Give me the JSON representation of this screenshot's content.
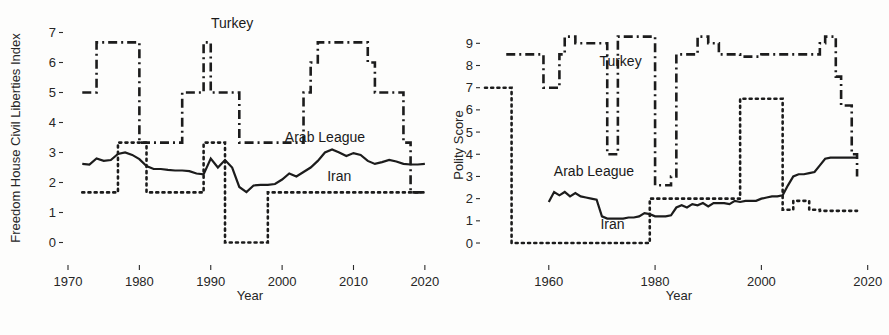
{
  "figure": {
    "background": "#fdfdfc",
    "line_color": "#1c1c1c",
    "panels": [
      "left",
      "right"
    ]
  },
  "chart_data": [
    {
      "id": "left",
      "type": "line",
      "title": "",
      "xlabel": "Year",
      "ylabel": "Freedom House Civil Liberties Index",
      "xlim": [
        1970,
        2021
      ],
      "ylim": [
        -0.35,
        7.35
      ],
      "xticks": [
        1970,
        1980,
        1990,
        2000,
        2010,
        2020
      ],
      "xticklabels": [
        "1970",
        "1980",
        "1990",
        "2000",
        "2010",
        "2020"
      ],
      "yticks": [
        0,
        1,
        2,
        3,
        4,
        5,
        6,
        7
      ],
      "yticklabels": [
        "0",
        "1",
        "2",
        "3",
        "4",
        "5",
        "6",
        "7"
      ],
      "grid": false,
      "legend_position": "inline-annotations",
      "annotations": [
        {
          "text": "Turkey",
          "x": 1993.0,
          "y": 7.15
        },
        {
          "text": "Arab League",
          "x": 2006.0,
          "y": 3.35
        },
        {
          "text": "Iran",
          "x": 2008.0,
          "y": 2.05
        }
      ],
      "series": [
        {
          "name": "Turkey",
          "style": "dashdot",
          "x": [
            1972,
            1973,
            1974,
            1975,
            1976,
            1977,
            1978,
            1979,
            1980,
            1981,
            1982,
            1983,
            1984,
            1985,
            1986,
            1987,
            1988,
            1989,
            1990,
            1991,
            1992,
            1993,
            1994,
            1995,
            1996,
            1997,
            1998,
            1999,
            2000,
            2001,
            2002,
            2003,
            2004,
            2005,
            2006,
            2007,
            2008,
            2009,
            2010,
            2011,
            2012,
            2013,
            2014,
            2015,
            2016,
            2017,
            2018,
            2019,
            2020
          ],
          "y": [
            5.0,
            5.0,
            6.67,
            6.67,
            6.67,
            6.67,
            6.67,
            6.67,
            3.33,
            3.33,
            3.33,
            3.33,
            3.33,
            3.33,
            5.0,
            5.0,
            5.0,
            6.67,
            5.0,
            5.0,
            5.0,
            5.0,
            3.33,
            3.33,
            3.33,
            3.33,
            3.33,
            3.33,
            3.33,
            3.33,
            3.33,
            5.0,
            6.0,
            6.67,
            6.67,
            6.67,
            6.67,
            6.67,
            6.67,
            6.67,
            6.0,
            5.0,
            5.0,
            5.0,
            5.0,
            3.33,
            1.67,
            1.67,
            1.67
          ]
        },
        {
          "name": "Arab League",
          "style": "solid",
          "x": [
            1972,
            1973,
            1974,
            1975,
            1976,
            1977,
            1978,
            1979,
            1980,
            1981,
            1982,
            1983,
            1984,
            1985,
            1986,
            1987,
            1988,
            1989,
            1990,
            1991,
            1992,
            1993,
            1994,
            1995,
            1996,
            1997,
            1998,
            1999,
            2000,
            2001,
            2002,
            2003,
            2004,
            2005,
            2006,
            2007,
            2008,
            2009,
            2010,
            2011,
            2012,
            2013,
            2014,
            2015,
            2016,
            2017,
            2018,
            2019,
            2020
          ],
          "y": [
            2.62,
            2.6,
            2.8,
            2.72,
            2.75,
            2.95,
            3.0,
            2.92,
            2.78,
            2.55,
            2.45,
            2.45,
            2.42,
            2.4,
            2.4,
            2.38,
            2.3,
            2.27,
            2.8,
            2.5,
            2.75,
            2.5,
            1.85,
            1.68,
            1.9,
            1.92,
            1.92,
            1.95,
            2.1,
            2.3,
            2.2,
            2.35,
            2.5,
            2.72,
            3.0,
            3.1,
            3.0,
            2.88,
            2.98,
            2.92,
            2.72,
            2.62,
            2.68,
            2.75,
            2.7,
            2.62,
            2.6,
            2.6,
            2.62
          ]
        },
        {
          "name": "Iran",
          "style": "dotted",
          "x": [
            1972,
            1973,
            1974,
            1975,
            1976,
            1977,
            1978,
            1979,
            1980,
            1981,
            1982,
            1983,
            1984,
            1985,
            1986,
            1987,
            1988,
            1989,
            1990,
            1991,
            1992,
            1993,
            1994,
            1995,
            1996,
            1997,
            1998,
            1999,
            2000,
            2001,
            2002,
            2003,
            2004,
            2005,
            2006,
            2007,
            2008,
            2009,
            2010,
            2011,
            2012,
            2013,
            2014,
            2015,
            2016,
            2017,
            2018,
            2019,
            2020
          ],
          "y": [
            1.67,
            1.67,
            1.67,
            1.67,
            1.67,
            3.33,
            3.33,
            3.33,
            3.33,
            1.67,
            1.67,
            1.67,
            1.67,
            1.67,
            1.67,
            1.67,
            1.67,
            3.33,
            3.33,
            3.33,
            0.0,
            0.0,
            0.0,
            0.0,
            0.0,
            0.0,
            1.67,
            1.67,
            1.67,
            1.67,
            1.67,
            1.67,
            1.67,
            1.67,
            1.67,
            1.67,
            1.67,
            1.67,
            1.67,
            1.67,
            1.67,
            1.67,
            1.67,
            1.67,
            1.67,
            1.67,
            1.67,
            1.67,
            1.67
          ]
        }
      ]
    },
    {
      "id": "right",
      "type": "line",
      "title": "",
      "xlabel": "Year",
      "ylabel": "Polity Score",
      "xlim": [
        1948,
        2021
      ],
      "ylim": [
        -0.45,
        9.6
      ],
      "xticks": [
        1960,
        1980,
        2000,
        2020
      ],
      "xticklabels": [
        "1960",
        "1980",
        "2000",
        "2020"
      ],
      "yticks": [
        0,
        1,
        2,
        3,
        4,
        5,
        6,
        7,
        8,
        9
      ],
      "yticklabels": [
        "0",
        "1",
        "2",
        "3",
        "4",
        "5",
        "6",
        "7",
        "8",
        "9"
      ],
      "grid": false,
      "legend_position": "inline-annotations",
      "annotations": [
        {
          "text": "Turkey",
          "x": 1973.5,
          "y": 8.0
        },
        {
          "text": "Arab League",
          "x": 1968.5,
          "y": 3.0
        },
        {
          "text": "Iran",
          "x": 1972.0,
          "y": 0.65
        }
      ],
      "series": [
        {
          "name": "Turkey",
          "style": "dashdot",
          "x": [
            1952,
            1953,
            1954,
            1955,
            1956,
            1957,
            1958,
            1959,
            1960,
            1961,
            1962,
            1963,
            1964,
            1965,
            1966,
            1967,
            1968,
            1969,
            1970,
            1971,
            1972,
            1973,
            1974,
            1975,
            1976,
            1977,
            1978,
            1979,
            1980,
            1981,
            1982,
            1983,
            1984,
            1985,
            1986,
            1987,
            1988,
            1989,
            1990,
            1991,
            1992,
            1993,
            1994,
            1995,
            1996,
            1997,
            1998,
            1999,
            2000,
            2001,
            2002,
            2003,
            2004,
            2005,
            2006,
            2007,
            2008,
            2009,
            2010,
            2011,
            2012,
            2013,
            2014,
            2015,
            2016,
            2017,
            2018
          ],
          "y": [
            8.5,
            8.5,
            8.5,
            8.5,
            8.5,
            8.5,
            8.5,
            7.0,
            7.0,
            7.0,
            8.5,
            9.3,
            9.3,
            9.0,
            9.0,
            9.0,
            9.0,
            9.0,
            9.0,
            4.0,
            4.0,
            9.3,
            9.3,
            9.3,
            9.3,
            9.3,
            9.3,
            9.3,
            2.6,
            2.6,
            2.6,
            3.0,
            8.5,
            8.5,
            8.5,
            8.5,
            9.3,
            9.3,
            9.0,
            9.0,
            8.5,
            8.5,
            8.5,
            8.5,
            8.4,
            8.4,
            8.4,
            8.4,
            8.5,
            8.5,
            8.5,
            8.5,
            8.5,
            8.5,
            8.5,
            8.5,
            8.5,
            8.5,
            8.5,
            9.0,
            9.3,
            9.3,
            7.5,
            6.2,
            6.2,
            4.0,
            3.0
          ]
        },
        {
          "name": "Arab League",
          "style": "solid",
          "x": [
            1960,
            1961,
            1962,
            1963,
            1964,
            1965,
            1966,
            1967,
            1968,
            1969,
            1970,
            1971,
            1972,
            1973,
            1974,
            1975,
            1976,
            1977,
            1978,
            1979,
            1980,
            1981,
            1982,
            1983,
            1984,
            1985,
            1986,
            1987,
            1988,
            1989,
            1990,
            1991,
            1992,
            1993,
            1994,
            1995,
            1996,
            1997,
            1998,
            1999,
            2000,
            2001,
            2002,
            2003,
            2004,
            2005,
            2006,
            2007,
            2008,
            2009,
            2010,
            2011,
            2012,
            2013,
            2014,
            2015,
            2016,
            2017,
            2018
          ],
          "y": [
            1.85,
            2.3,
            2.15,
            2.3,
            2.1,
            2.25,
            2.1,
            2.05,
            2.0,
            1.95,
            1.2,
            1.1,
            1.1,
            1.1,
            1.1,
            1.15,
            1.15,
            1.2,
            1.35,
            1.3,
            1.2,
            1.2,
            1.2,
            1.25,
            1.6,
            1.7,
            1.6,
            1.75,
            1.7,
            1.8,
            1.65,
            1.8,
            1.8,
            1.8,
            1.75,
            1.9,
            1.85,
            1.9,
            1.9,
            1.9,
            2.0,
            2.05,
            2.1,
            2.1,
            2.15,
            2.6,
            3.0,
            3.1,
            3.1,
            3.15,
            3.2,
            3.5,
            3.8,
            3.85,
            3.85,
            3.85,
            3.85,
            3.85,
            3.85
          ]
        },
        {
          "name": "Iran",
          "style": "dotted",
          "x": [
            1948,
            1949,
            1950,
            1951,
            1952,
            1953,
            1954,
            1955,
            1956,
            1957,
            1958,
            1959,
            1960,
            1961,
            1962,
            1963,
            1964,
            1965,
            1966,
            1967,
            1968,
            1969,
            1970,
            1971,
            1972,
            1973,
            1974,
            1975,
            1976,
            1977,
            1978,
            1979,
            1980,
            1981,
            1982,
            1983,
            1984,
            1985,
            1986,
            1987,
            1988,
            1989,
            1990,
            1991,
            1992,
            1993,
            1994,
            1995,
            1996,
            1997,
            1998,
            1999,
            2000,
            2001,
            2002,
            2003,
            2004,
            2005,
            2006,
            2007,
            2008,
            2009,
            2010,
            2011,
            2012,
            2013,
            2014,
            2015,
            2016,
            2017,
            2018
          ],
          "y": [
            7.0,
            7.0,
            7.0,
            7.0,
            7.0,
            0.0,
            0.0,
            0.0,
            0.0,
            0.0,
            0.0,
            0.0,
            0.0,
            0.0,
            0.0,
            0.0,
            0.0,
            0.0,
            0.0,
            0.0,
            0.0,
            0.0,
            0.0,
            0.0,
            0.0,
            0.0,
            0.0,
            0.0,
            0.0,
            0.0,
            0.0,
            2.0,
            2.0,
            2.0,
            2.0,
            2.0,
            2.0,
            2.0,
            2.0,
            2.0,
            2.0,
            2.0,
            2.0,
            2.0,
            2.0,
            2.0,
            2.0,
            2.0,
            6.5,
            6.5,
            6.5,
            6.5,
            6.5,
            6.5,
            6.5,
            6.5,
            1.5,
            1.5,
            1.9,
            1.9,
            1.9,
            1.5,
            1.5,
            1.45,
            1.45,
            1.45,
            1.45,
            1.45,
            1.45,
            1.45,
            1.45
          ]
        }
      ]
    }
  ]
}
